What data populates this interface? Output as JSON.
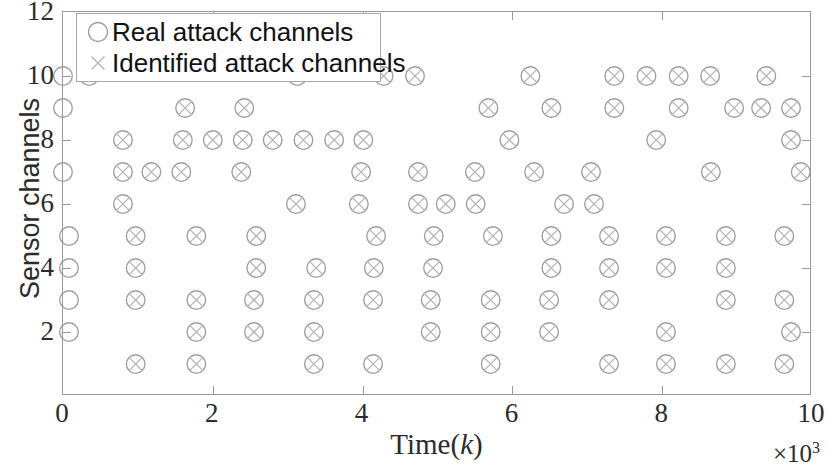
{
  "chart_data": {
    "type": "scatter",
    "title": "",
    "xlabel": "Time(k)",
    "ylabel": "Sensor channels",
    "x_exponent_label": "×10³",
    "x_exponent_base": "×10",
    "x_exponent_power": "3",
    "xlim": [
      0,
      10
    ],
    "ylim": [
      0,
      12
    ],
    "x_ticks": [
      0,
      2,
      4,
      6,
      8,
      10
    ],
    "x_tick_labels": [
      "0",
      "2",
      "4",
      "6",
      "8",
      "10"
    ],
    "y_ticks": [
      2,
      4,
      6,
      8,
      10,
      12
    ],
    "y_tick_labels": [
      "2",
      "4",
      "6",
      "8",
      "10",
      "12"
    ],
    "grid": false,
    "legend_position": "top-left-inside",
    "marker_color": "#9e9e9e",
    "axis_color": "#9a9a9a",
    "text_color": "#2b2b2b",
    "series": [
      {
        "name": "Real attack channels",
        "marker": "circle",
        "color": "#9e9e9e",
        "points": [
          [
            0.0,
            10
          ],
          [
            0.35,
            10
          ],
          [
            3.13,
            10
          ],
          [
            4.28,
            10
          ],
          [
            4.7,
            10
          ],
          [
            6.24,
            10
          ],
          [
            7.36,
            10
          ],
          [
            7.79,
            10
          ],
          [
            8.22,
            10
          ],
          [
            8.64,
            10
          ],
          [
            9.39,
            10
          ],
          [
            0.0,
            9
          ],
          [
            1.63,
            9
          ],
          [
            2.42,
            9
          ],
          [
            5.68,
            9
          ],
          [
            6.52,
            9
          ],
          [
            7.36,
            9
          ],
          [
            8.22,
            9
          ],
          [
            8.96,
            9
          ],
          [
            9.32,
            9
          ],
          [
            9.72,
            9
          ],
          [
            0.8,
            8
          ],
          [
            1.6,
            8
          ],
          [
            2.0,
            8
          ],
          [
            2.4,
            8
          ],
          [
            2.8,
            8
          ],
          [
            3.21,
            8
          ],
          [
            3.62,
            8
          ],
          [
            4.01,
            8
          ],
          [
            5.96,
            8
          ],
          [
            7.92,
            8
          ],
          [
            9.72,
            8
          ],
          [
            0.0,
            7
          ],
          [
            0.8,
            7
          ],
          [
            1.18,
            7
          ],
          [
            1.58,
            7
          ],
          [
            2.38,
            7
          ],
          [
            3.98,
            7
          ],
          [
            4.74,
            7
          ],
          [
            5.5,
            7
          ],
          [
            6.29,
            7
          ],
          [
            7.05,
            7
          ],
          [
            8.65,
            7
          ],
          [
            9.85,
            7
          ],
          [
            0.8,
            6
          ],
          [
            3.11,
            6
          ],
          [
            3.95,
            6
          ],
          [
            4.74,
            6
          ],
          [
            5.11,
            6
          ],
          [
            5.51,
            6
          ],
          [
            6.69,
            6
          ],
          [
            7.09,
            6
          ],
          [
            0.08,
            5
          ],
          [
            0.97,
            5
          ],
          [
            1.78,
            5
          ],
          [
            2.58,
            5
          ],
          [
            4.18,
            5
          ],
          [
            4.95,
            5
          ],
          [
            5.74,
            5
          ],
          [
            6.52,
            5
          ],
          [
            7.29,
            5
          ],
          [
            8.05,
            5
          ],
          [
            8.85,
            5
          ],
          [
            9.63,
            5
          ],
          [
            0.08,
            4
          ],
          [
            0.97,
            4
          ],
          [
            2.58,
            4
          ],
          [
            3.38,
            4
          ],
          [
            4.15,
            4
          ],
          [
            4.94,
            4
          ],
          [
            6.52,
            4
          ],
          [
            7.29,
            4
          ],
          [
            8.05,
            4
          ],
          [
            8.85,
            4
          ],
          [
            0.08,
            3
          ],
          [
            0.97,
            3
          ],
          [
            1.78,
            3
          ],
          [
            2.55,
            3
          ],
          [
            3.35,
            3
          ],
          [
            4.14,
            3
          ],
          [
            4.91,
            3
          ],
          [
            5.71,
            3
          ],
          [
            6.49,
            3
          ],
          [
            7.29,
            3
          ],
          [
            8.85,
            3
          ],
          [
            9.63,
            3
          ],
          [
            0.08,
            2
          ],
          [
            1.78,
            2
          ],
          [
            2.55,
            2
          ],
          [
            3.35,
            2
          ],
          [
            4.91,
            2
          ],
          [
            5.71,
            2
          ],
          [
            6.49,
            2
          ],
          [
            8.05,
            2
          ],
          [
            9.72,
            2
          ],
          [
            0.97,
            1
          ],
          [
            1.78,
            1
          ],
          [
            3.35,
            1
          ],
          [
            4.14,
            1
          ],
          [
            5.71,
            1
          ],
          [
            7.29,
            1
          ],
          [
            8.05,
            1
          ],
          [
            8.85,
            1
          ],
          [
            9.63,
            1
          ]
        ]
      },
      {
        "name": "Identified attack channels",
        "marker": "x",
        "color": "#9e9e9e",
        "points": [
          [
            4.28,
            10
          ],
          [
            4.7,
            10
          ],
          [
            6.24,
            10
          ],
          [
            7.36,
            10
          ],
          [
            7.79,
            10
          ],
          [
            8.22,
            10
          ],
          [
            8.64,
            10
          ],
          [
            9.39,
            10
          ],
          [
            1.63,
            9
          ],
          [
            2.42,
            9
          ],
          [
            5.68,
            9
          ],
          [
            6.52,
            9
          ],
          [
            7.36,
            9
          ],
          [
            8.22,
            9
          ],
          [
            8.96,
            9
          ],
          [
            9.32,
            9
          ],
          [
            9.72,
            9
          ],
          [
            0.8,
            8
          ],
          [
            1.6,
            8
          ],
          [
            2.0,
            8
          ],
          [
            2.4,
            8
          ],
          [
            2.8,
            8
          ],
          [
            3.21,
            8
          ],
          [
            3.62,
            8
          ],
          [
            4.01,
            8
          ],
          [
            5.96,
            8
          ],
          [
            7.92,
            8
          ],
          [
            9.72,
            8
          ],
          [
            0.8,
            7
          ],
          [
            1.18,
            7
          ],
          [
            1.58,
            7
          ],
          [
            2.38,
            7
          ],
          [
            3.98,
            7
          ],
          [
            4.74,
            7
          ],
          [
            5.5,
            7
          ],
          [
            6.29,
            7
          ],
          [
            7.05,
            7
          ],
          [
            8.65,
            7
          ],
          [
            9.85,
            7
          ],
          [
            0.8,
            6
          ],
          [
            3.11,
            6
          ],
          [
            3.95,
            6
          ],
          [
            4.74,
            6
          ],
          [
            5.11,
            6
          ],
          [
            5.51,
            6
          ],
          [
            6.69,
            6
          ],
          [
            7.09,
            6
          ],
          [
            0.97,
            5
          ],
          [
            1.78,
            5
          ],
          [
            2.58,
            5
          ],
          [
            4.18,
            5
          ],
          [
            4.95,
            5
          ],
          [
            5.74,
            5
          ],
          [
            6.52,
            5
          ],
          [
            7.29,
            5
          ],
          [
            8.05,
            5
          ],
          [
            8.85,
            5
          ],
          [
            9.63,
            5
          ],
          [
            0.97,
            4
          ],
          [
            2.58,
            4
          ],
          [
            3.38,
            4
          ],
          [
            4.15,
            4
          ],
          [
            4.94,
            4
          ],
          [
            6.52,
            4
          ],
          [
            7.29,
            4
          ],
          [
            8.05,
            4
          ],
          [
            8.85,
            4
          ],
          [
            0.97,
            3
          ],
          [
            1.78,
            3
          ],
          [
            2.55,
            3
          ],
          [
            3.35,
            3
          ],
          [
            4.14,
            3
          ],
          [
            4.91,
            3
          ],
          [
            5.71,
            3
          ],
          [
            6.49,
            3
          ],
          [
            7.29,
            3
          ],
          [
            8.85,
            3
          ],
          [
            9.63,
            3
          ],
          [
            1.78,
            2
          ],
          [
            2.55,
            2
          ],
          [
            3.35,
            2
          ],
          [
            4.91,
            2
          ],
          [
            5.71,
            2
          ],
          [
            6.49,
            2
          ],
          [
            8.05,
            2
          ],
          [
            9.72,
            2
          ],
          [
            0.97,
            1
          ],
          [
            1.78,
            1
          ],
          [
            3.35,
            1
          ],
          [
            4.14,
            1
          ],
          [
            5.71,
            1
          ],
          [
            7.29,
            1
          ],
          [
            8.05,
            1
          ],
          [
            8.85,
            1
          ],
          [
            9.63,
            1
          ]
        ]
      }
    ]
  },
  "legend": {
    "real_label": "Real attack channels",
    "identified_label": "Identified attack channels"
  }
}
